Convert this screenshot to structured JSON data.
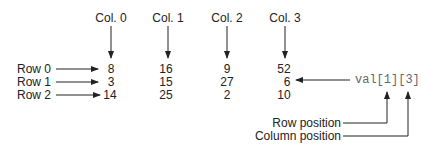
{
  "columns": [
    "Col. 0",
    "Col. 1",
    "Col. 2",
    "Col. 3"
  ],
  "rows": [
    "Row 0",
    "Row 1",
    "Row 2"
  ],
  "values": [
    [
      "8",
      "16",
      "9",
      "52"
    ],
    [
      "3",
      "15",
      "27",
      "6"
    ],
    [
      "14",
      "25",
      "2",
      "10"
    ]
  ],
  "expression": "val[1][3]",
  "annotations": {
    "row_position": "Row position",
    "column_position": "Column position"
  }
}
